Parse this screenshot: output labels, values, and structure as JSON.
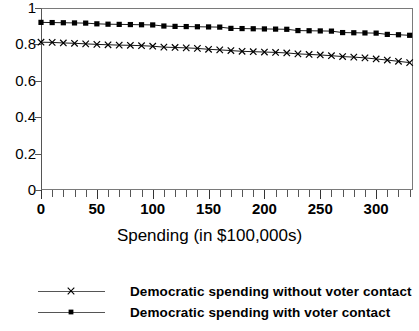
{
  "chart_data": {
    "type": "line",
    "title": "",
    "xlabel": "Spending (in $100,000s)",
    "ylabel": "",
    "xlim": [
      0,
      333
    ],
    "ylim": [
      0,
      1
    ],
    "grid": false,
    "legend_position": "bottom",
    "y_ticks": [
      "0",
      "0.2",
      "0.4",
      "0.6",
      "0.8",
      "1"
    ],
    "y_tick_values": [
      0,
      0.2,
      0.4,
      0.6,
      0.8,
      1
    ],
    "x_ticks": [
      "0",
      "50",
      "100",
      "150",
      "200",
      "250",
      "300"
    ],
    "x_tick_values": [
      0,
      50,
      100,
      150,
      200,
      250,
      300
    ],
    "x_minor_tick_step": 10,
    "x": [
      0,
      10,
      20,
      30,
      40,
      50,
      60,
      70,
      80,
      90,
      100,
      110,
      120,
      130,
      140,
      150,
      160,
      170,
      180,
      190,
      200,
      210,
      220,
      230,
      240,
      250,
      260,
      270,
      280,
      290,
      300,
      310,
      320,
      330
    ],
    "series": [
      {
        "name": "Democratic spending with voter contact",
        "marker": "square",
        "color": "#000000",
        "values": [
          0.921,
          0.92,
          0.919,
          0.918,
          0.917,
          0.913,
          0.911,
          0.91,
          0.909,
          0.908,
          0.907,
          0.901,
          0.899,
          0.898,
          0.897,
          0.896,
          0.895,
          0.888,
          0.887,
          0.886,
          0.885,
          0.884,
          0.883,
          0.876,
          0.875,
          0.874,
          0.873,
          0.865,
          0.864,
          0.863,
          0.862,
          0.855,
          0.853,
          0.85
        ]
      },
      {
        "name": "Democratic spending without voter contact",
        "marker": "x",
        "color": "#000000",
        "values": [
          0.812,
          0.811,
          0.808,
          0.806,
          0.803,
          0.8,
          0.798,
          0.796,
          0.795,
          0.793,
          0.79,
          0.785,
          0.783,
          0.781,
          0.778,
          0.773,
          0.77,
          0.766,
          0.762,
          0.76,
          0.758,
          0.756,
          0.753,
          0.748,
          0.745,
          0.742,
          0.738,
          0.733,
          0.73,
          0.726,
          0.72,
          0.714,
          0.707,
          0.7
        ]
      }
    ]
  },
  "legend": {
    "items": [
      {
        "label": "Democratic spending without voter contact",
        "marker": "x"
      },
      {
        "label": "Democratic spending with voter contact",
        "marker": "square"
      }
    ]
  }
}
